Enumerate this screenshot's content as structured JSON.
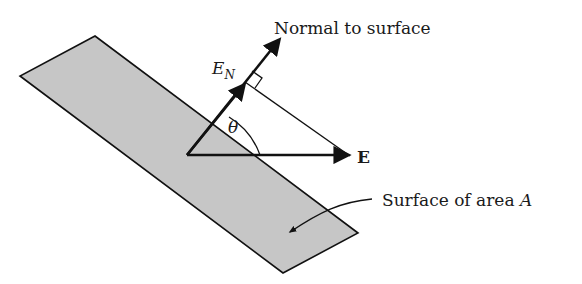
{
  "diagram": {
    "labels": {
      "normal": "Normal to surface",
      "en_main": "E",
      "en_sub": "N",
      "theta": "θ",
      "e_field": "E",
      "surface": "Surface of area ",
      "surface_var": "A"
    },
    "colors": {
      "surface_fill": "#c6c6c6",
      "stroke": "#111111",
      "background": "#ffffff"
    }
  }
}
